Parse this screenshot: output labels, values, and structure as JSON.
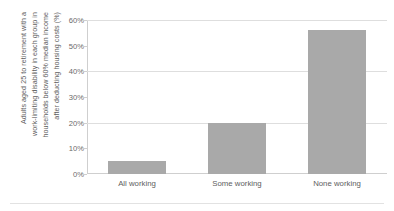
{
  "chart_data": {
    "type": "bar",
    "title": "",
    "subtitle": "",
    "xlabel": "",
    "ylabel_lines": [
      "Adults aged 25 to retirement with a",
      "work-limiting disability in each group in",
      "households below 60% median income",
      "after deducting housing costs (%)"
    ],
    "ylabel": "Adults aged 25 to retirement with a work-limiting disability in each group in households below 60% median income after deducting housing costs (%)",
    "categories": [
      "All working",
      "Some working",
      "None working"
    ],
    "values": [
      5,
      20,
      56
    ],
    "ylim": [
      0,
      60
    ],
    "yticks": [
      0,
      10,
      20,
      30,
      40,
      50,
      60
    ],
    "ytick_labels": [
      "0%",
      "10%",
      "20%",
      "30%",
      "40%",
      "50%",
      "60%"
    ],
    "gridline_values": [
      20,
      40,
      60
    ],
    "grid": true,
    "legend": false,
    "legend_position": "none",
    "colors": {
      "bar": "#a9a9a9",
      "gridline": "#dedede",
      "axis": "#cfcfcf",
      "text": "#5e5e5e",
      "background": "#ffffff",
      "rule": "#e2e2e2"
    }
  }
}
